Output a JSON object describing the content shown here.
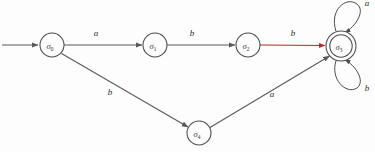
{
  "diagram": {
    "type": "finite-state-automaton",
    "title": "",
    "background_color": "#fdfdfd",
    "default_edge_color": "#585858",
    "highlight_edge_color": "#b02b2b",
    "node_stroke_color": "#4a4a4a",
    "states": [
      {
        "id": "s0",
        "label": "σ",
        "subscript": "0",
        "cx": 52,
        "cy": 45,
        "r": 12,
        "accepting": false,
        "initial": true
      },
      {
        "id": "s1",
        "label": "σ",
        "subscript": "1",
        "cx": 155,
        "cy": 45,
        "r": 12,
        "accepting": false,
        "initial": false
      },
      {
        "id": "s2",
        "label": "σ",
        "subscript": "2",
        "cx": 248,
        "cy": 45,
        "r": 12,
        "accepting": false,
        "initial": false
      },
      {
        "id": "s3",
        "label": "σ",
        "subscript": "3",
        "cx": 341,
        "cy": 46,
        "r": 15,
        "accepting": true,
        "initial": false
      },
      {
        "id": "s4",
        "label": "σ",
        "subscript": "4",
        "cx": 199,
        "cy": 133,
        "r": 12,
        "accepting": false,
        "initial": false
      }
    ],
    "transitions": [
      {
        "id": "t0",
        "from": "s0",
        "to": "s1",
        "symbol": "a",
        "label_x": 96,
        "label_y": 36,
        "color": "#585858"
      },
      {
        "id": "t1",
        "from": "s1",
        "to": "s2",
        "symbol": "b",
        "label_x": 192,
        "label_y": 36,
        "color": "#585858"
      },
      {
        "id": "t2",
        "from": "s2",
        "to": "s3",
        "symbol": "b",
        "label_x": 293,
        "label_y": 36,
        "color": "#b02b2b"
      },
      {
        "id": "t3",
        "from": "s0",
        "to": "s4",
        "symbol": "b",
        "label_x": 110,
        "label_y": 95,
        "color": "#585858"
      },
      {
        "id": "t4",
        "from": "s4",
        "to": "s3",
        "symbol": "a",
        "label_x": 272,
        "label_y": 97,
        "color": "#585858"
      },
      {
        "id": "t5",
        "from": "s3",
        "to": "s3",
        "symbol": "a",
        "label_x": 367,
        "label_y": 6,
        "color": "#4a4a4a",
        "self_loop": "top"
      },
      {
        "id": "t6",
        "from": "s3",
        "to": "s3",
        "symbol": "b",
        "label_x": 367,
        "label_y": 91,
        "color": "#4a4a4a",
        "self_loop": "bottom"
      }
    ],
    "start_arrow": {
      "x1": 2,
      "y1": 45,
      "x2": 38,
      "y2": 45
    }
  }
}
